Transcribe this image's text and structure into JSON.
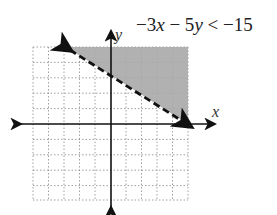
{
  "inequality": {
    "text": "−3x − 5y <  −15",
    "parts": [
      "−3",
      "x",
      " − 5",
      "y",
      " <  −15"
    ]
  },
  "axes": {
    "x_label": "x",
    "y_label": "y",
    "x_range": [
      -5,
      5
    ],
    "y_range": [
      -5,
      5
    ]
  },
  "boundary": {
    "style": "dashed",
    "from": [
      -3,
      5
    ],
    "to": [
      5,
      0
    ],
    "equation": "y = 3 - 0.6x"
  },
  "shading": {
    "region": "above boundary",
    "color": "#a9a9a9"
  }
}
